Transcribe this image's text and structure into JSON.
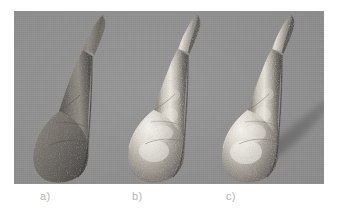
{
  "figure": {
    "name": "three-shaded-renderings-figure",
    "background_color": "#ffffff",
    "panel": {
      "background_color": "#919191",
      "width_px": 310,
      "height_px": 173
    },
    "caption_color": "#b4b4b4"
  },
  "panels": [
    {
      "id": "a",
      "caption": "a)",
      "object_name": "horn-teardrop-shape",
      "shading": "diffuse",
      "surface_color": "#6d6a66",
      "highlight_color": "#9a958e",
      "shadow_visible": false,
      "shadow_color": "#7d7d7d"
    },
    {
      "id": "b",
      "caption": "b)",
      "object_name": "horn-teardrop-shape",
      "shading": "specular",
      "surface_color": "#8e8a84",
      "highlight_color": "#f2f0ea",
      "shadow_visible": false,
      "shadow_color": "#7d7d7d"
    },
    {
      "id": "c",
      "caption": "c)",
      "object_name": "horn-teardrop-shape",
      "shading": "specular-with-cast-shadow",
      "surface_color": "#8e8a84",
      "highlight_color": "#f4f2ec",
      "shadow_visible": true,
      "shadow_color": "#6f6f6f"
    }
  ]
}
